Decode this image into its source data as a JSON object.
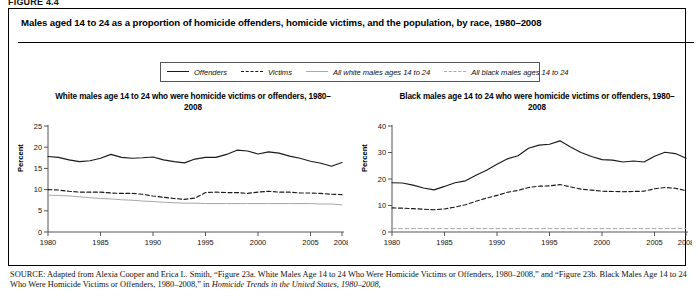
{
  "figure": {
    "label": "FIGURE 4.4",
    "title": "Males aged 14 to 24 as a proportion of homicide offenders, homicide victims, and the population, by race, 1980–2008"
  },
  "legend": {
    "items": [
      {
        "label": "Offenders",
        "style": "solid",
        "color": "#1a1a1a"
      },
      {
        "label": "Victims",
        "style": "dashed",
        "color": "#1a1a1a"
      },
      {
        "label": "All white males ages 14 to 24",
        "style": "solid",
        "color": "#a8a8a8"
      },
      {
        "label": "All black males ages 14 to 24",
        "style": "dashed",
        "color": "#a8a8a8"
      }
    ]
  },
  "source": {
    "prefix": "SOURCE:",
    "line1": " Adapted from Alexia Cooper and Erica L. Smith, “Figure 23a. White Males Age 14 to 24 Who Were Homicide Victims or Offenders, 1980–2008,”",
    "line2a": "and “Figure 23b. Black Males Age 14 to 24 Who Were Homicide Victims or Offenders, 1980–2008,” in ",
    "line2b": "Homicide Trends in the United States, 1980–2008,"
  },
  "chart_data": [
    {
      "type": "line",
      "title": "White males age 14 to 24 who were homicide victims or offenders, 1980–2008",
      "xlabel": "",
      "ylabel": "Percent",
      "ylim": [
        0,
        25
      ],
      "yticks": [
        0,
        5,
        10,
        15,
        20,
        25
      ],
      "xlim": [
        1980,
        2008
      ],
      "xticks": [
        1980,
        1985,
        1990,
        1995,
        2000,
        2005,
        2008
      ],
      "xtick_labels": [
        "1980",
        "1985",
        "1990",
        "1995",
        "2000",
        "2005",
        "2008"
      ],
      "grid": false,
      "legend_position": "above-figure",
      "x": [
        1980,
        1981,
        1982,
        1983,
        1984,
        1985,
        1986,
        1987,
        1988,
        1989,
        1990,
        1991,
        1992,
        1993,
        1994,
        1995,
        1996,
        1997,
        1998,
        1999,
        2000,
        2001,
        2002,
        2003,
        2004,
        2005,
        2006,
        2007,
        2008
      ],
      "series": [
        {
          "name": "Offenders",
          "style": "solid",
          "color": "#1a1a1a",
          "values": [
            17.8,
            17.6,
            17.0,
            16.6,
            16.8,
            17.4,
            18.3,
            17.6,
            17.4,
            17.5,
            17.7,
            17.0,
            16.6,
            16.3,
            17.2,
            17.6,
            17.6,
            18.3,
            19.3,
            19.1,
            18.4,
            18.9,
            18.6,
            17.9,
            17.4,
            16.7,
            16.2,
            15.5,
            16.4
          ]
        },
        {
          "name": "Victims",
          "style": "dashed",
          "color": "#1a1a1a",
          "values": [
            10.0,
            9.9,
            9.6,
            9.4,
            9.4,
            9.4,
            9.2,
            9.1,
            9.1,
            8.9,
            8.5,
            8.2,
            7.9,
            7.7,
            8.0,
            9.3,
            9.4,
            9.3,
            9.3,
            9.1,
            9.4,
            9.6,
            9.4,
            9.4,
            9.2,
            9.2,
            9.1,
            8.9,
            8.8
          ]
        },
        {
          "name": "All white males ages 14 to 24",
          "style": "solid",
          "color": "#a8a8a8",
          "values": [
            8.7,
            8.6,
            8.5,
            8.3,
            8.1,
            7.9,
            7.8,
            7.6,
            7.5,
            7.3,
            7.2,
            7.0,
            6.9,
            6.8,
            6.8,
            6.7,
            6.7,
            6.7,
            6.7,
            6.7,
            6.7,
            6.7,
            6.7,
            6.7,
            6.7,
            6.7,
            6.6,
            6.6,
            6.4
          ]
        }
      ]
    },
    {
      "type": "line",
      "title": "Black males age 14 to 24 who were homicide victims or offenders, 1980–2008",
      "xlabel": "",
      "ylabel": "Percent",
      "ylim": [
        0,
        40
      ],
      "yticks": [
        0,
        10,
        20,
        30,
        40
      ],
      "xlim": [
        1980,
        2008
      ],
      "xticks": [
        1980,
        1985,
        1990,
        1995,
        2000,
        2005,
        2008
      ],
      "xtick_labels": [
        "1980",
        "1985",
        "1990",
        "1995",
        "2000",
        "2005",
        "2008"
      ],
      "grid": false,
      "legend_position": "above-figure",
      "x": [
        1980,
        1981,
        1982,
        1983,
        1984,
        1985,
        1986,
        1987,
        1988,
        1989,
        1990,
        1991,
        1992,
        1993,
        1994,
        1995,
        1996,
        1997,
        1998,
        1999,
        2000,
        2001,
        2002,
        2003,
        2004,
        2005,
        2006,
        2007,
        2008
      ],
      "series": [
        {
          "name": "Offenders",
          "style": "solid",
          "color": "#1a1a1a",
          "values": [
            18.6,
            18.5,
            17.7,
            16.6,
            15.9,
            17.2,
            18.6,
            19.3,
            21.4,
            23.3,
            25.6,
            27.6,
            28.8,
            31.6,
            32.8,
            33.1,
            34.4,
            32.1,
            30.0,
            28.5,
            27.3,
            27.1,
            26.4,
            26.8,
            26.4,
            28.6,
            30.1,
            29.6,
            27.8
          ]
        },
        {
          "name": "Victims",
          "style": "dashed",
          "color": "#1a1a1a",
          "values": [
            9.1,
            9.0,
            8.8,
            8.6,
            8.4,
            8.7,
            9.4,
            10.3,
            11.6,
            12.8,
            13.8,
            15.0,
            15.7,
            16.8,
            17.3,
            17.4,
            17.9,
            17.0,
            16.2,
            15.8,
            15.4,
            15.3,
            15.2,
            15.3,
            15.4,
            16.3,
            16.8,
            16.5,
            15.6
          ]
        },
        {
          "name": "All black males ages 14 to 24",
          "style": "dashed",
          "color": "#a8a8a8",
          "values": [
            1.3,
            1.3,
            1.3,
            1.3,
            1.3,
            1.3,
            1.3,
            1.3,
            1.3,
            1.3,
            1.3,
            1.3,
            1.3,
            1.3,
            1.3,
            1.3,
            1.3,
            1.3,
            1.3,
            1.3,
            1.3,
            1.3,
            1.3,
            1.3,
            1.3,
            1.3,
            1.3,
            1.3,
            1.3
          ]
        }
      ]
    }
  ]
}
